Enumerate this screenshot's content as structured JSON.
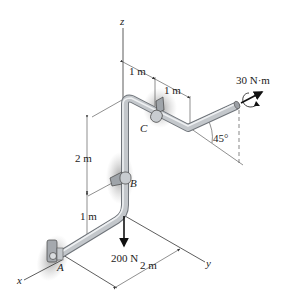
{
  "figure": {
    "axes": {
      "x": "x",
      "y": "y",
      "z": "z"
    },
    "points": {
      "A": "A",
      "B": "B",
      "C": "C"
    },
    "dimensions": {
      "top_first": "1 m",
      "top_second": "1 m",
      "vertical_upper": "2 m",
      "vertical_lower": "1 m",
      "base": "2 m"
    },
    "loads": {
      "force": "200 N",
      "couple_moment": "30 N·m",
      "angle": "45°"
    },
    "colors": {
      "pipe": "#b8bcc0",
      "pipe_highlight": "#e8eaec",
      "support_shadow": "#9a9a9a",
      "ink": "#222222"
    }
  }
}
